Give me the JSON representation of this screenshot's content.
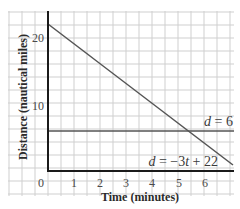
{
  "chart_data": {
    "type": "line",
    "title": "",
    "xlabel": "Time (minutes)",
    "ylabel": "Distance (nautical miles)",
    "xlim": [
      0,
      7
    ],
    "ylim": [
      0,
      23
    ],
    "x_ticks": [
      "0",
      "1",
      "2",
      "3",
      "4",
      "5",
      "6"
    ],
    "y_ticks": [
      "10",
      "20"
    ],
    "grid": true,
    "legend": "none",
    "series": [
      {
        "name": "d = -3t + 22",
        "label_parts": {
          "var": "d",
          "rest": " = −3",
          "var2": "t",
          "rest2": " + 22"
        },
        "x": [
          0,
          7
        ],
        "y": [
          22,
          1
        ],
        "color": "#555555"
      },
      {
        "name": "d = 6",
        "label_parts": {
          "var": "d",
          "rest": " = 6"
        },
        "x": [
          0,
          7
        ],
        "y": [
          6,
          6
        ],
        "color": "#555555"
      }
    ],
    "annotations": [
      "d = 6",
      "d = -3t + 22"
    ]
  },
  "labels": {
    "xlabel": "Time (minutes)",
    "ylabel": "Distance (nautical miles)",
    "xticks": [
      "0",
      "1",
      "2",
      "3",
      "4",
      "5",
      "6"
    ],
    "yticks": [
      "10",
      "20"
    ],
    "eq1_var": "d",
    "eq1_rest": " = 6",
    "eq2_var": "d",
    "eq2_mid": " = −3",
    "eq2_var2": "t",
    "eq2_rest": " + 22"
  },
  "colors": {
    "grid": "#cfcfcf",
    "axis": "#1a1a1a",
    "line": "#555555"
  }
}
